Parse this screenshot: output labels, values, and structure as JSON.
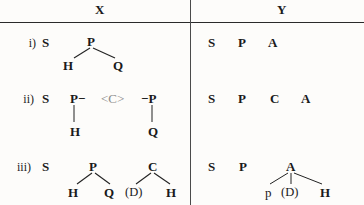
{
  "figure": {
    "columns": [
      {
        "id": "X",
        "label": "X"
      },
      {
        "id": "Y",
        "label": "Y"
      }
    ],
    "row_labels": [
      "i)",
      "ii)",
      "iii)"
    ],
    "rows": [
      {
        "label": "i)",
        "x_side": {
          "nodes": [
            "S",
            "P",
            "H",
            "Q"
          ],
          "root": "S",
          "branch_parent": "P",
          "branch_children": [
            "H",
            "Q"
          ]
        },
        "y_side": {
          "nodes": [
            "S",
            "P",
            "A"
          ]
        }
      },
      {
        "label": "ii)",
        "x_side": {
          "nodes": [
            "S",
            "P-",
            "<C>",
            "-P",
            "H",
            "Q"
          ],
          "root": "S",
          "left_group": "P-",
          "center_group": "<C>",
          "right_group": "-P",
          "left_child": "H",
          "right_child": "Q"
        },
        "y_side": {
          "nodes": [
            "S",
            "P",
            "C",
            "A"
          ]
        }
      },
      {
        "label": "iii)",
        "x_side": {
          "nodes": [
            "S",
            "P",
            "C",
            "H",
            "Q",
            "(D)",
            "H"
          ],
          "root": "S",
          "tree1_parent": "P",
          "tree1_children": [
            "H",
            "Q"
          ],
          "tree2_parent": "C",
          "tree2_children": [
            "(D)",
            "H"
          ]
        },
        "y_side": {
          "nodes": [
            "S",
            "P",
            "A",
            "p",
            "(D)",
            "H"
          ],
          "tree_parent": "A",
          "tree_children": [
            "p",
            "(D)",
            "H"
          ]
        }
      }
    ],
    "labels": {
      "head_x": "X",
      "head_y": "Y",
      "r1_label": "i)",
      "r1_x_s": "S",
      "r1_x_p": "P",
      "r1_x_h": "H",
      "r1_x_q": "Q",
      "r1_y_s": "S",
      "r1_y_p": "P",
      "r1_y_a": "A",
      "r2_label": "ii)",
      "r2_x_s": "S",
      "r2_x_pleft": "P−",
      "r2_x_c": "<C>",
      "r2_x_pright": "−P",
      "r2_x_h": "H",
      "r2_x_q": "Q",
      "r2_y_s": "S",
      "r2_y_p": "P",
      "r2_y_c": "C",
      "r2_y_a": "A",
      "r3_label": "iii)",
      "r3_x_s": "S",
      "r3_x_p": "P",
      "r3_x_c": "C",
      "r3_x_h1": "H",
      "r3_x_q": "Q",
      "r3_x_d": "(D)",
      "r3_x_h2": "H",
      "r3_y_s": "S",
      "r3_y_p": "P",
      "r3_y_a": "A",
      "r3_y_p_low": "p",
      "r3_y_d": "(D)",
      "r3_y_h": "H"
    }
  }
}
